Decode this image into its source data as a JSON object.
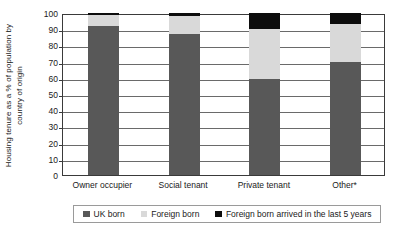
{
  "chart_data": {
    "type": "bar",
    "subtype": "stacked-bar-100",
    "title": "",
    "xlabel": "",
    "ylabel": "Housing tenure as a % of population by country of origin",
    "ylabel_line1": "Housing tenure as a % of population by",
    "ylabel_line2": "country of origin",
    "ylim": [
      0,
      100
    ],
    "ytick_step": 10,
    "yticks": [
      100,
      90,
      80,
      70,
      60,
      50,
      40,
      30,
      20,
      10,
      0
    ],
    "grid": true,
    "legend_position": "bottom",
    "categories": [
      "Owner occupier",
      "Social tenant",
      "Private tenant",
      "Other*"
    ],
    "series": [
      {
        "name": "UK born",
        "color": "#585858",
        "values": [
          92,
          87,
          59,
          70
        ]
      },
      {
        "name": "Foreign born",
        "color": "#d9d9d9",
        "values": [
          7,
          11,
          31,
          23
        ]
      },
      {
        "name": "Foreign born arrived in the last 5 years",
        "color": "#0d0d0d",
        "values": [
          1,
          2,
          10,
          7
        ]
      }
    ]
  },
  "legend": {
    "items": [
      {
        "label": "UK born",
        "color": "#585858"
      },
      {
        "label": "Foreign born",
        "color": "#d9d9d9"
      },
      {
        "label": "Foreign born arrived in the last 5 years",
        "color": "#0d0d0d"
      }
    ]
  }
}
